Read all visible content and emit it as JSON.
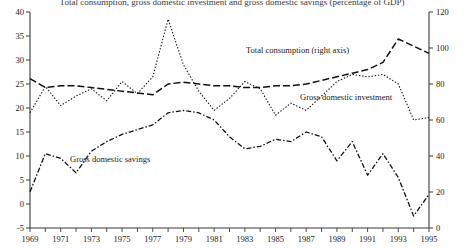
{
  "title": "Total consumption, gross domestic investment and gross domestic savings (percentage of GDP)",
  "axes": {
    "left": {
      "ticks": [
        "40",
        "35",
        "30",
        "25",
        "20",
        "15",
        "10",
        "5",
        "0",
        "-5"
      ],
      "min": -5,
      "max": 40
    },
    "right": {
      "ticks": [
        "120",
        "100",
        "80",
        "60",
        "40",
        "20",
        "0"
      ],
      "min": 0,
      "max": 120
    },
    "bottom": {
      "ticks": [
        "1969",
        "1971",
        "1973",
        "1975",
        "1977",
        "1979",
        "1981",
        "1983",
        "1985",
        "1987",
        "1989",
        "1991",
        "1993",
        "1995"
      ]
    }
  },
  "labels": {
    "consumption": "Total consumption (right axis)",
    "investment": "Gross domestic investment",
    "savings": "Gross domestic savings"
  },
  "colors": {
    "line": "#111111",
    "axis": "#3a3a3a",
    "background": "#ffffff"
  },
  "chart_data": {
    "type": "line",
    "title": "Total consumption, gross domestic investment and gross domestic savings (percentage of GDP)",
    "xlabel": "",
    "ylabel": "",
    "grid": false,
    "legend_position": "inline-annotations",
    "x": [
      1969,
      1970,
      1971,
      1972,
      1973,
      1974,
      1975,
      1976,
      1977,
      1978,
      1979,
      1980,
      1981,
      1982,
      1983,
      1984,
      1985,
      1986,
      1987,
      1988,
      1989,
      1990,
      1991,
      1992,
      1993,
      1994,
      1995
    ],
    "ylim_left": [
      -5,
      40
    ],
    "ylim_right": [
      0,
      120
    ],
    "series": [
      {
        "name": "Total consumption (right axis)",
        "axis": "right",
        "units": "percent of GDP",
        "values": [
          83,
          78,
          79,
          79,
          78,
          77,
          76,
          75,
          74,
          80,
          81,
          80,
          79,
          79,
          78,
          78,
          79,
          79,
          80,
          82,
          84,
          86,
          88,
          92,
          105,
          101,
          97
        ]
      },
      {
        "name": "Gross domestic investment",
        "axis": "left",
        "units": "percent of GDP",
        "values": [
          19.0,
          24.5,
          20.5,
          22.5,
          24.0,
          21.5,
          25.5,
          23.0,
          26.5,
          38.5,
          29.0,
          23.5,
          19.5,
          22.0,
          25.5,
          24.0,
          18.5,
          21.0,
          19.5,
          22.5,
          25.5,
          27.0,
          26.5,
          27.0,
          25.0,
          17.5,
          18.0
        ]
      },
      {
        "name": "Gross domestic savings",
        "axis": "left",
        "units": "percent of GDP",
        "values": [
          2.5,
          10.5,
          9.5,
          6.5,
          11.0,
          13.0,
          14.5,
          15.5,
          16.5,
          19.0,
          19.5,
          19.0,
          17.5,
          14.0,
          11.5,
          12.0,
          13.5,
          13.0,
          15.0,
          14.0,
          9.0,
          13.0,
          6.0,
          10.5,
          5.5,
          -2.5,
          2.0
        ]
      }
    ]
  }
}
